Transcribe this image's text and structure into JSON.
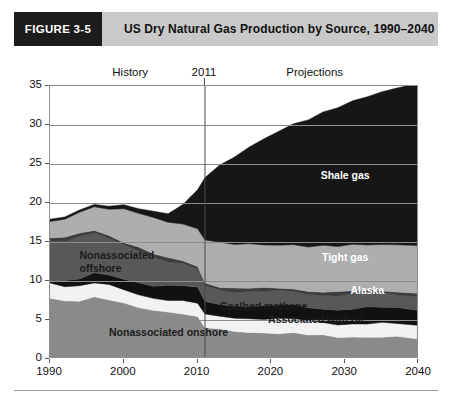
{
  "figure": {
    "number": "FIGURE 3-5",
    "title": "US Dry Natural Gas Production by Source, 1990–2040",
    "number_box_color": "#1c1c1c",
    "header_band_color": "#c9c9c9"
  },
  "annotations": {
    "history": "History",
    "divider_year": "2011",
    "projections": "Projections"
  },
  "chart_data": {
    "type": "area",
    "title": "US Dry Natural Gas Production by Source, 1990–2040",
    "subtitle": "",
    "xlabel": "",
    "ylabel": "Trillion Cubic Feet",
    "xlim": [
      1990,
      2040
    ],
    "ylim": [
      0,
      35
    ],
    "yticks": [
      0,
      5,
      10,
      15,
      20,
      25,
      30,
      35
    ],
    "xticks": [
      1990,
      2000,
      2010,
      2020,
      2030,
      2040
    ],
    "grid": true,
    "legend_position": "inline-labels",
    "stacked": true,
    "stack_order_bottom_to_top": [
      "Nonassociated onshore",
      "Associated with oil",
      "Coalbed methane",
      "Nonassociated offshore",
      "Alaska",
      "Tight gas",
      "Shale gas"
    ],
    "divider_x": 2011,
    "x": [
      1990,
      1992,
      1994,
      1996,
      1998,
      2000,
      2002,
      2004,
      2006,
      2008,
      2010,
      2011,
      2013,
      2015,
      2017,
      2019,
      2021,
      2023,
      2025,
      2027,
      2029,
      2031,
      2033,
      2035,
      2037,
      2040
    ],
    "series": [
      {
        "name": "Nonassociated onshore",
        "color": "#8a8a8a",
        "label_color": "#1b1b1b",
        "values": [
          7.8,
          7.5,
          7.6,
          7.9,
          7.6,
          7.0,
          6.6,
          6.3,
          6.1,
          5.9,
          5.3,
          4.0,
          3.7,
          3.6,
          3.5,
          3.4,
          3.3,
          3.2,
          3.1,
          3.0,
          2.9,
          2.9,
          2.8,
          2.8,
          2.7,
          2.6
        ]
      },
      {
        "name": "Associated with oil",
        "color": "#f2f2f2",
        "label_color": "#1b1b1b",
        "values": [
          2.0,
          2.0,
          1.9,
          1.8,
          1.8,
          1.7,
          1.7,
          1.6,
          1.6,
          1.6,
          1.7,
          1.6,
          1.7,
          1.8,
          1.8,
          1.8,
          1.8,
          1.8,
          1.7,
          1.7,
          1.7,
          1.7,
          1.7,
          1.7,
          1.7,
          1.7
        ]
      },
      {
        "name": "Coalbed methane",
        "color": "#111111",
        "label_color": "#1b1b1b",
        "values": [
          0.4,
          0.7,
          0.9,
          1.1,
          1.2,
          1.4,
          1.6,
          1.7,
          1.8,
          1.9,
          1.9,
          1.7,
          1.6,
          1.6,
          1.6,
          1.6,
          1.7,
          1.7,
          1.8,
          1.8,
          1.9,
          1.9,
          2.0,
          2.0,
          2.0,
          2.1
        ]
      },
      {
        "name": "Nonassociated offshore",
        "color": "#585858",
        "label_color": "#1b1b1b",
        "values": [
          5.1,
          5.0,
          5.3,
          5.1,
          4.8,
          4.5,
          4.2,
          3.6,
          3.0,
          2.7,
          2.4,
          2.1,
          1.9,
          1.8,
          1.8,
          1.8,
          1.8,
          1.8,
          1.8,
          1.8,
          1.8,
          1.8,
          1.8,
          1.8,
          1.8,
          1.8
        ]
      },
      {
        "name": "Alaska",
        "color": "#3d3d3d",
        "label_color": "#ffffff",
        "values": [
          0.4,
          0.4,
          0.4,
          0.4,
          0.4,
          0.4,
          0.4,
          0.4,
          0.4,
          0.4,
          0.4,
          0.4,
          0.4,
          0.4,
          0.4,
          0.4,
          0.4,
          0.4,
          0.4,
          0.4,
          0.4,
          0.4,
          0.4,
          0.4,
          0.4,
          0.4
        ]
      },
      {
        "name": "Tight gas",
        "color": "#aeaeae",
        "label_color": "#ffffff",
        "values": [
          1.9,
          2.3,
          2.7,
          3.1,
          3.5,
          4.2,
          4.3,
          4.5,
          4.6,
          4.8,
          4.9,
          5.6,
          5.6,
          5.6,
          5.6,
          5.6,
          5.6,
          5.7,
          5.7,
          5.8,
          5.8,
          5.9,
          5.9,
          6.0,
          6.0,
          6.1
        ]
      },
      {
        "name": "Shale gas",
        "color": "#161616",
        "label_color": "#ffffff",
        "values": [
          0.3,
          0.3,
          0.3,
          0.3,
          0.4,
          0.5,
          0.6,
          0.8,
          1.1,
          2.5,
          5.0,
          8.0,
          9.9,
          11.2,
          12.4,
          13.6,
          14.6,
          15.5,
          16.3,
          17.1,
          17.8,
          18.4,
          19.0,
          19.6,
          20.1,
          20.8
        ]
      }
    ],
    "series_label_positions": [
      {
        "name": "Shale gas",
        "x": 2030,
        "y": 23.5
      },
      {
        "name": "Tight gas",
        "x": 2030,
        "y": 13.0
      },
      {
        "name": "Alaska",
        "x": 2033,
        "y": 8.7
      },
      {
        "name": "Coalbed methane",
        "x": 2013,
        "y": 6.7
      },
      {
        "name": "Associated with oil",
        "x": 2026,
        "y": 5.0
      },
      {
        "name": "Nonassociated offshore",
        "x": 1994,
        "y": 13.2
      },
      {
        "name": "Nonassociated onshore",
        "x": 1998,
        "y": 3.3
      }
    ]
  }
}
